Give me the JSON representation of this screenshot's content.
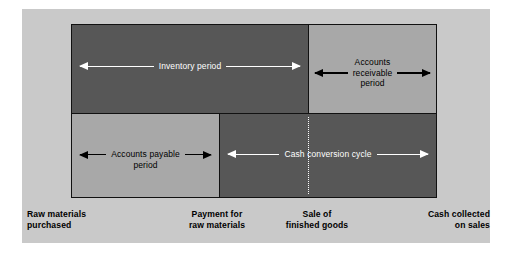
{
  "figure": {
    "type": "cash-conversion-cycle-timeline",
    "colors": {
      "panel_background": "#c9c9c9",
      "dark_block": "#575757",
      "light_block": "#a8a8a8",
      "block_border": "#111111",
      "arrow_on_dark": "#ffffff",
      "arrow_on_light": "#000000",
      "dotted_divider": "#ffffff"
    },
    "periods": [
      {
        "id": "inventory",
        "label": "Inventory period",
        "row": "top",
        "shade": "dark",
        "arrow_color": "#ffffff",
        "from_event": "Raw materials purchased",
        "to_event": "Sale of finished goods"
      },
      {
        "id": "accounts-receivable",
        "label": "Accounts\nreceivable\nperiod",
        "row": "top",
        "shade": "light",
        "arrow_color": "#000000",
        "from_event": "Sale of finished goods",
        "to_event": "Cash collected on sales"
      },
      {
        "id": "accounts-payable",
        "label": "Accounts payable\nperiod",
        "row": "bottom",
        "shade": "light",
        "arrow_color": "#000000",
        "from_event": "Raw materials purchased",
        "to_event": "Payment for raw materials"
      },
      {
        "id": "cash-conversion-cycle",
        "label": "Cash conversion cycle",
        "row": "bottom",
        "shade": "dark",
        "arrow_color": "#ffffff",
        "from_event": "Payment for raw materials",
        "to_event": "Cash collected on sales"
      }
    ],
    "events": [
      {
        "id": "raw-materials-purchased",
        "label": "Raw materials\npurchased"
      },
      {
        "id": "payment-for-raw-materials",
        "label": "Payment for\nraw materials"
      },
      {
        "id": "sale-of-finished-goods",
        "label": "Sale of\nfinished goods"
      },
      {
        "id": "cash-collected-on-sales",
        "label": "Cash collected\non sales"
      }
    ]
  }
}
